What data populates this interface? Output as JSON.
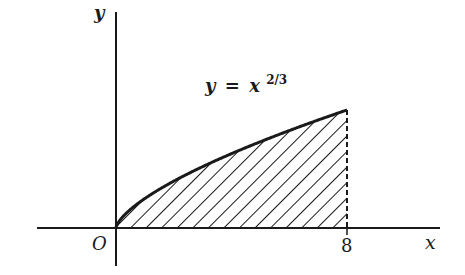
{
  "figure": {
    "type": "area-under-curve",
    "function": "y = x^(2/3)",
    "equation_label": {
      "lhs": "y",
      "equals": "=",
      "base": "x",
      "exponent": "2/3"
    },
    "axes": {
      "x_label": "x",
      "y_label": "y",
      "origin_label": "O"
    },
    "x_tick_label": "8",
    "shaded_region": {
      "from_x": 0,
      "to_x": 8,
      "pattern": "diagonal hatching",
      "boundary_right": "dashed vertical line at x = 8"
    },
    "colors": {
      "ink": "#1a1a1a",
      "background": "#ffffff"
    }
  }
}
